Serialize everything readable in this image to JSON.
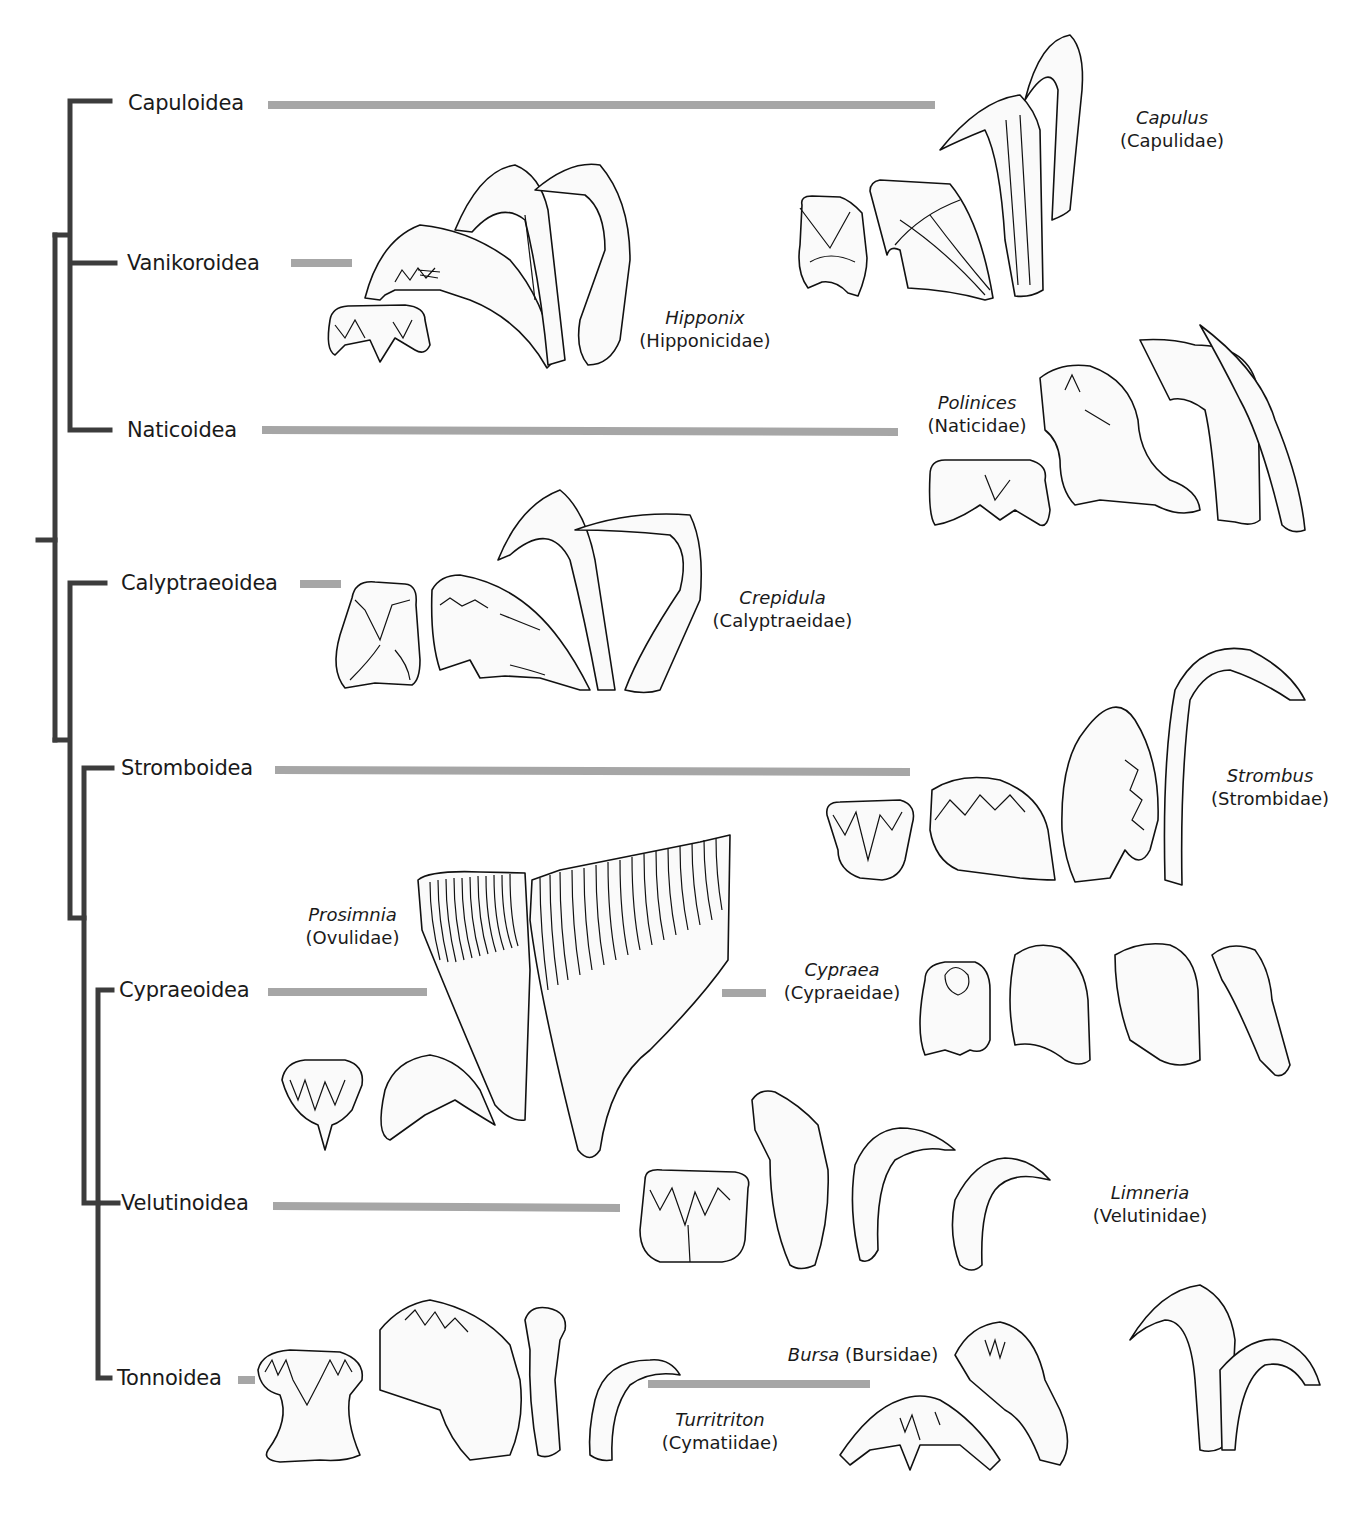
{
  "figure": {
    "type": "phylogenetic tree with radular tooth illustrations",
    "colors": {
      "tree": "#3c3c3c",
      "connector": "#a6a6a6",
      "outline": "#111111"
    }
  },
  "clades": [
    {
      "label": "Capuloidea",
      "y": 103
    },
    {
      "label": "Vanikoroidea",
      "y": 263
    },
    {
      "label": "Naticoidea",
      "y": 430
    },
    {
      "label": "Calyptraeoidea",
      "y": 583
    },
    {
      "label": "Stromboidea",
      "y": 768
    },
    {
      "label": "Cypraeoidea",
      "y": 990
    },
    {
      "label": "Velutinoidea",
      "y": 1203
    },
    {
      "label": "Tonnoidea",
      "y": 1378
    }
  ],
  "taxa": [
    {
      "genus": "Capulus",
      "family": "(Capulidae)",
      "clade": "Capuloidea"
    },
    {
      "genus": "Hipponix",
      "family": "(Hipponicidae)",
      "clade": "Vanikoroidea"
    },
    {
      "genus": "Polinices",
      "family": "(Naticidae)",
      "clade": "Naticoidea"
    },
    {
      "genus": "Crepidula",
      "family": "(Calyptraeidae)",
      "clade": "Calyptraeoidea"
    },
    {
      "genus": "Strombus",
      "family": "(Strombidae)",
      "clade": "Stromboidea"
    },
    {
      "genus": "Prosimnia",
      "family": "(Ovulidae)",
      "clade": "Cypraeoidea"
    },
    {
      "genus": "Cypraea",
      "family": "(Cypraeidae)",
      "clade": "Cypraeoidea"
    },
    {
      "genus": "Limneria",
      "family": "(Velutinidae)",
      "clade": "Velutinoidea"
    },
    {
      "genus": "Turritriton",
      "family": "(Cymatiidae)",
      "clade": "Tonnoidea"
    },
    {
      "genus": "Bursa",
      "family": "(Bursidae)",
      "clade": "Tonnoidea"
    }
  ],
  "tree_topology": "((Capuloidea, Vanikoroidea, Naticoidea), (Calyptraeoidea, (Stromboidea, (Cypraeoidea, Velutinoidea, Tonnoidea))))"
}
